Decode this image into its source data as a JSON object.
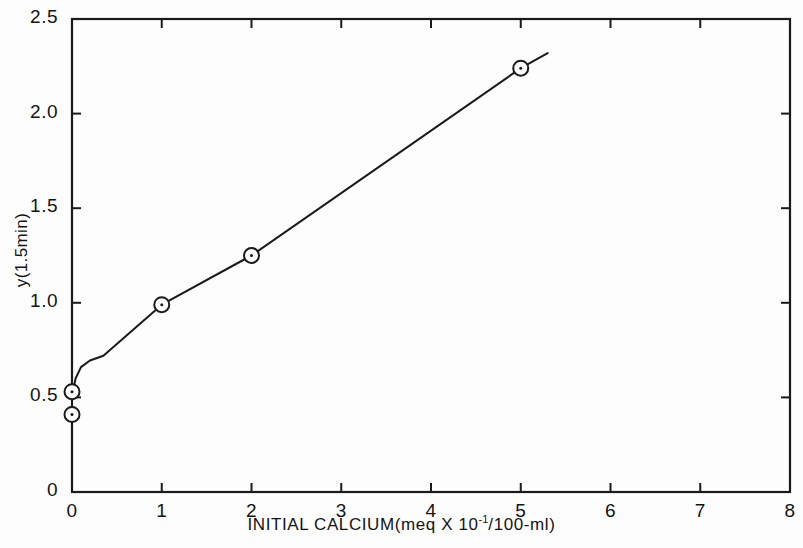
{
  "chart_data": {
    "type": "line",
    "title": "",
    "xlabel": "INITIAL CALCIUM(meq X 10",
    "xlabel_exponent": "-1",
    "xlabel_tail": "/100-ml)",
    "xlabel_full": "INITIAL CALCIUM(meq X 10^-1/100-ml)",
    "ylabel": "y(1.5min)",
    "xlim": [
      0,
      8
    ],
    "ylim": [
      0,
      2.5
    ],
    "xticks": [
      0,
      1,
      2,
      3,
      4,
      5,
      6,
      7,
      8
    ],
    "xtick_labels": [
      "0",
      "1",
      "2",
      "3",
      "4",
      "5",
      "6",
      "7",
      "8"
    ],
    "yticks": [
      0,
      0.5,
      1.0,
      1.5,
      2.0,
      2.5
    ],
    "ytick_labels": [
      "0",
      "0.5",
      "1.0",
      "1.5",
      "2.0",
      "2.5"
    ],
    "grid": false,
    "legend": null,
    "marker": "open-circle-with-dot",
    "line_color": "#1a1a1a",
    "axis_color": "#1a1a1a",
    "points": [
      {
        "x": 0.0,
        "y": 0.41
      },
      {
        "x": 0.0,
        "y": 0.53
      },
      {
        "x": 1.0,
        "y": 0.99
      },
      {
        "x": 2.0,
        "y": 1.25
      },
      {
        "x": 5.0,
        "y": 2.24
      }
    ],
    "curve": [
      {
        "x": 0.0,
        "y": 0.51
      },
      {
        "x": 0.04,
        "y": 0.6
      },
      {
        "x": 0.1,
        "y": 0.66
      },
      {
        "x": 0.2,
        "y": 0.695
      },
      {
        "x": 0.35,
        "y": 0.72
      },
      {
        "x": 1.0,
        "y": 0.99
      },
      {
        "x": 2.0,
        "y": 1.25
      },
      {
        "x": 5.0,
        "y": 2.24
      },
      {
        "x": 5.3,
        "y": 2.32
      }
    ]
  }
}
